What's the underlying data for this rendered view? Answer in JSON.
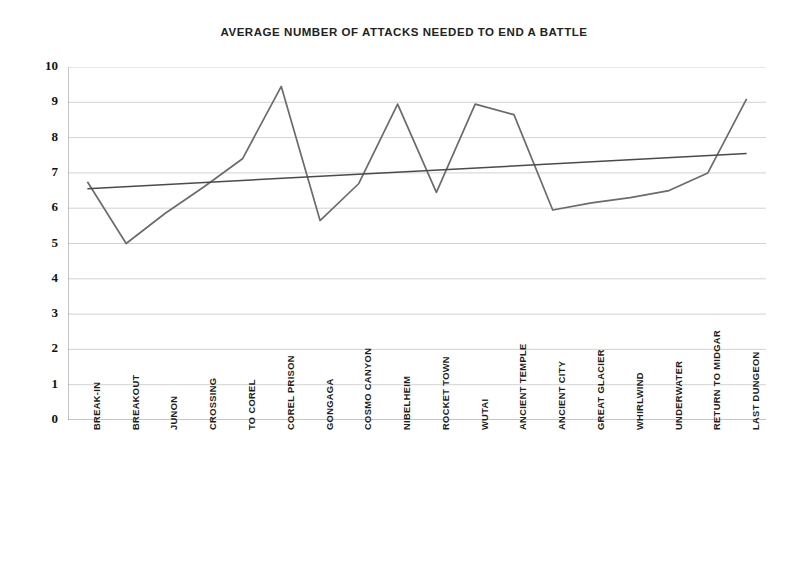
{
  "chart_data": {
    "type": "line",
    "title": "AVERAGE NUMBER OF ATTACKS NEEDED TO END A BATTLE",
    "xlabel": "",
    "ylabel": "",
    "ylim": [
      0,
      10
    ],
    "ytick_labels": [
      "10",
      "9",
      "8",
      "7",
      "6",
      "5",
      "4",
      "3",
      "2",
      "1",
      "0"
    ],
    "ytick_values": [
      10,
      9,
      8,
      7,
      6,
      5,
      4,
      3,
      2,
      1,
      0
    ],
    "grid": true,
    "grid_axis": "y",
    "legend": false,
    "legend_position": "none",
    "categories": [
      "BREAK-IN",
      "BREAKOUT",
      "JUNON",
      "CROSSING",
      "TO COREL",
      "COREL PRISON",
      "GONGAGA",
      "COSMO CANYON",
      "NIBELHEIM",
      "ROCKET TOWN",
      "WUTAI",
      "ANCIENT TEMPLE",
      "ANCIENT CITY",
      "GREAT GLACIER",
      "WHIRLWIND",
      "UNDERWATER",
      "RETURN TO MIDGAR",
      "LAST DUNGEON"
    ],
    "series": [
      {
        "name": "Average attacks",
        "type": "line",
        "color": "#6b6b6b",
        "values": [
          6.75,
          5.0,
          5.85,
          6.6,
          7.4,
          9.45,
          5.65,
          6.7,
          8.95,
          6.45,
          8.95,
          8.65,
          5.95,
          6.15,
          6.3,
          6.5,
          7.0,
          9.1
        ]
      },
      {
        "name": "Linear trendline",
        "type": "trendline",
        "color": "#4a4a4a",
        "values": [
          6.55,
          6.61,
          6.67,
          6.73,
          6.79,
          6.85,
          6.91,
          6.97,
          7.03,
          7.08,
          7.14,
          7.2,
          7.26,
          7.32,
          7.38,
          7.44,
          7.5,
          7.55
        ]
      }
    ]
  },
  "axes": {
    "y_axis_name": "y-axis",
    "x_axis_name": "x-axis"
  }
}
